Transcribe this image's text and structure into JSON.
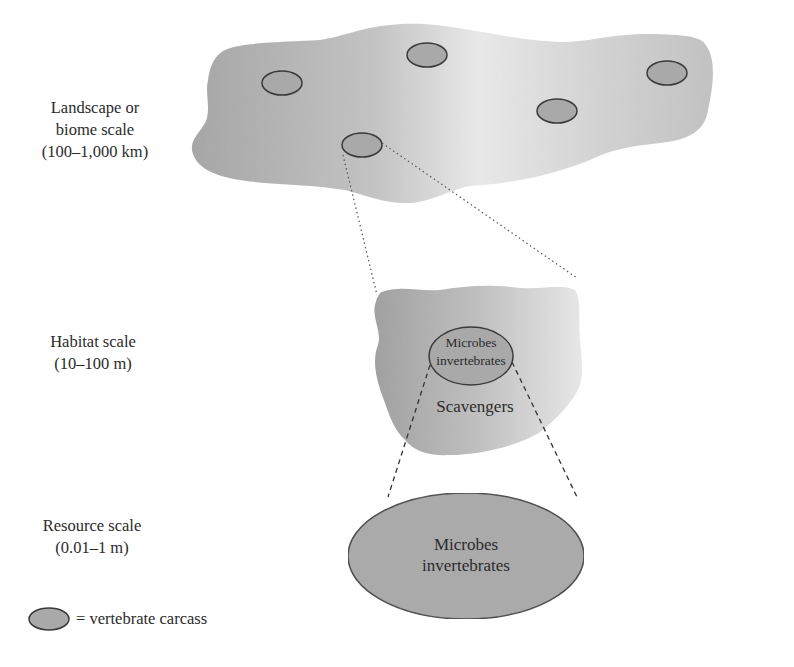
{
  "scales": {
    "landscape": {
      "line1": "Landscape or",
      "line2": "biome scale",
      "line3": "(100–1,000 km)"
    },
    "habitat": {
      "line1": "Habitat scale",
      "line2": "(10–100 m)"
    },
    "resource": {
      "line1": "Resource scale",
      "line2": "(0.01–1 m)"
    }
  },
  "habitat_ellipse": {
    "line1": "Microbes",
    "line2": "invertebrates"
  },
  "habitat_outer_label": "Scavengers",
  "resource_ellipse": {
    "line1": "Microbes",
    "line2": "invertebrates"
  },
  "legend": {
    "symbol": "ellipse",
    "label": "= vertebrate carcass"
  },
  "colors": {
    "carcass_fill": "#a9a9a9",
    "carcass_stroke": "#3a3a3a",
    "region_dark": "#a6a6a6",
    "region_light": "#ececec"
  }
}
